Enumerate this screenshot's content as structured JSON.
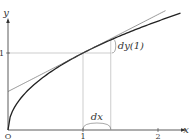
{
  "chart_data": {
    "type": "line",
    "title": "",
    "xlabel": "x",
    "ylabel": "y",
    "xlim": [
      0,
      2.4
    ],
    "ylim": [
      0,
      1.65
    ],
    "x_ticks": [
      {
        "value": 0,
        "label": "O"
      },
      {
        "value": 1,
        "label": "1"
      },
      {
        "value": 2,
        "label": "2"
      }
    ],
    "y_ticks": [
      {
        "value": 1,
        "label": "1"
      }
    ],
    "grid": false,
    "series": [
      {
        "name": "curve",
        "function": "sqrt(x)",
        "x_range": [
          0,
          2.3
        ],
        "style": "solid",
        "color": "#222222"
      },
      {
        "name": "tangent",
        "function": "0.5*x + 0.5",
        "x_range": [
          0,
          2.1
        ],
        "style": "solid-thin",
        "color": "#555555"
      }
    ],
    "annotations": {
      "point": {
        "x": 1,
        "y": 1
      },
      "dx": {
        "label": "dx",
        "from": 1,
        "to": 1.37
      },
      "dy": {
        "label": "dy(1)",
        "x": 1.37,
        "from": 1,
        "to": 1.185
      }
    }
  }
}
